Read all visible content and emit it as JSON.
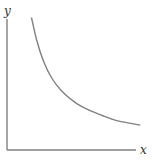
{
  "chart_data": {
    "type": "line",
    "title": "",
    "xlabel": "x",
    "ylabel": "y",
    "x_ticks": [],
    "y_ticks": [],
    "grid": false,
    "legend": null,
    "xlim": [
      0,
      10
    ],
    "ylim": [
      0,
      10
    ],
    "series": [
      {
        "name": "inverse curve",
        "description": "decreasing convex curve, y proportional to 1/x",
        "x": [
          1.8,
          2.2,
          2.7,
          3.3,
          4.0,
          5.0,
          6.0,
          7.0,
          8.0,
          9.0,
          9.8
        ],
        "y": [
          9.6,
          7.9,
          6.4,
          5.2,
          4.3,
          3.45,
          2.9,
          2.5,
          2.15,
          1.95,
          1.8
        ]
      }
    ],
    "colors": {
      "axis": "#808080",
      "curve": "#808080",
      "label": "#333333"
    }
  }
}
